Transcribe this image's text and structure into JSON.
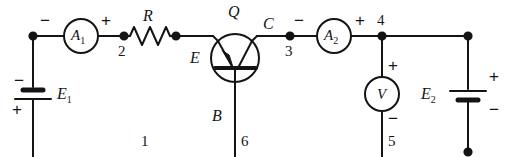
{
  "figure": {
    "name": "transistor-amplifier-circuit-diagram",
    "background_color": "#ffffff",
    "ink_color": "#141414"
  },
  "components": {
    "ammeter_1": {
      "label": "A",
      "subscript": "1",
      "minus": "−",
      "plus": "+"
    },
    "ammeter_2": {
      "label": "A",
      "subscript": "2",
      "minus": "−",
      "plus": "+"
    },
    "voltmeter": {
      "label": "V",
      "plus": "+",
      "minus": "−"
    },
    "resistor": {
      "label": "R"
    },
    "transistor": {
      "label": "Q",
      "emitter": "E",
      "collector": "C",
      "base": "B"
    },
    "battery_1": {
      "label": "E",
      "subscript": "1",
      "minus": "−",
      "plus": "+"
    },
    "battery_2": {
      "label": "E",
      "subscript": "2",
      "plus": "+",
      "minus": "−"
    }
  },
  "nodes": {
    "n1": "1",
    "n2": "2",
    "n3": "3",
    "n4": "4",
    "n5": "5",
    "n6": "6"
  }
}
